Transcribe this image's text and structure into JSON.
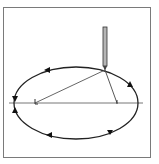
{
  "diagram": {
    "frame": {
      "x": 3,
      "y": 7,
      "width": 147,
      "height": 150,
      "stroke": "#7a7a7a"
    },
    "ellipse": {
      "cx": 76,
      "cy": 103,
      "rx": 62,
      "ry": 36,
      "stroke": "#222222",
      "direction": "counterclockwise"
    },
    "major_axis": {
      "x1": 9,
      "x2": 143,
      "y": 103,
      "stroke": "#777777"
    },
    "foci": [
      {
        "name": "left-focus",
        "x": 35,
        "y": 103
      },
      {
        "name": "right-focus",
        "x": 117,
        "y": 103
      }
    ],
    "pencil": {
      "x": 105,
      "top": 27,
      "tip": 70,
      "width": 4,
      "fill": "#b5b5b5",
      "stroke": "#333333"
    },
    "arrows": [
      {
        "x": 47,
        "y": 70,
        "angle": 190
      },
      {
        "x": 15,
        "y": 99,
        "angle": 270
      },
      {
        "x": 15,
        "y": 109,
        "angle": 270
      },
      {
        "x": 50,
        "y": 135,
        "angle": 0
      },
      {
        "x": 110,
        "y": 131,
        "angle": -20
      },
      {
        "x": 130,
        "y": 85,
        "angle": -110
      }
    ]
  }
}
